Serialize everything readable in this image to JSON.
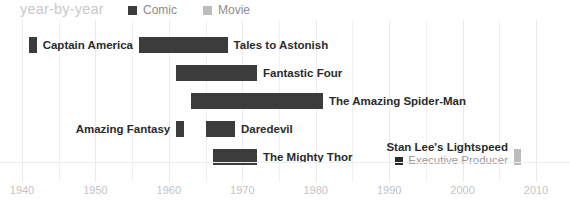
{
  "header": {
    "title": "year-by-year"
  },
  "legend": {
    "position": "top",
    "items": [
      {
        "label": "Comic",
        "color": "#3c3c3c",
        "icon": "square-swatch-icon"
      },
      {
        "label": "Movie",
        "color": "#bcbcbc",
        "icon": "square-swatch-icon"
      }
    ]
  },
  "axis": {
    "ticks": [
      "1940",
      "1950",
      "1960",
      "1970",
      "1980",
      "1990",
      "2000",
      "2010"
    ],
    "min": 1940,
    "max": 2010,
    "minor_step": 5
  },
  "annotation": {
    "title": "Stan Lee's Lightspeed",
    "role": "Executive Producer",
    "marker_icon": "role-marker-icon"
  },
  "chart_data": {
    "type": "bar",
    "orientation": "horizontal-timeline",
    "title": "year-by-year",
    "xlabel": "",
    "ylabel": "",
    "xlim": [
      1940,
      2010
    ],
    "grid": true,
    "legend_position": "top",
    "categories": [
      "Captain America",
      "Tales to Astonish",
      "Fantastic Four",
      "The Amazing Spider-Man",
      "Amazing Fantasy",
      "Daredevil",
      "The Mighty Thor",
      "Stan Lee's Lightspeed"
    ],
    "series": [
      {
        "name": "Comic",
        "color": "#3c3c3c",
        "items": [
          {
            "label": "Captain America",
            "start": 1941,
            "end": 1942,
            "row": 0,
            "label_side": "right"
          },
          {
            "label": "Tales to Astonish",
            "start": 1956,
            "end": 1968,
            "row": 0,
            "label_side": "right"
          },
          {
            "label": "Fantastic Four",
            "start": 1961,
            "end": 1972,
            "row": 1,
            "label_side": "right"
          },
          {
            "label": "The Amazing Spider-Man",
            "start": 1963,
            "end": 1981,
            "row": 2,
            "label_side": "right"
          },
          {
            "label": "Amazing Fantasy",
            "start": 1961,
            "end": 1962,
            "row": 3,
            "label_side": "left"
          },
          {
            "label": "Daredevil",
            "start": 1965,
            "end": 1969,
            "row": 3,
            "label_side": "right"
          },
          {
            "label": "The Mighty Thor",
            "start": 1966,
            "end": 1972,
            "row": 4,
            "label_side": "right"
          }
        ]
      },
      {
        "name": "Movie",
        "color": "#bcbcbc",
        "items": [
          {
            "label": "Stan Lee's Lightspeed",
            "start": 2007,
            "end": 2008,
            "row": 4,
            "label_side": "left"
          }
        ]
      }
    ]
  }
}
